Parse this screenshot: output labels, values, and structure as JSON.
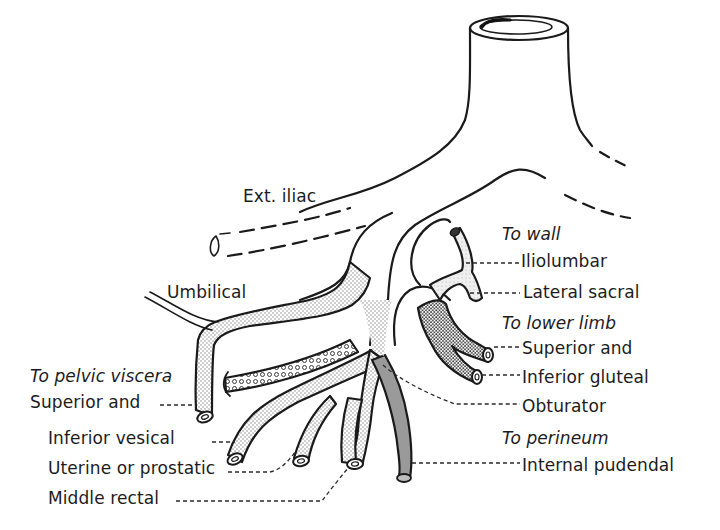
{
  "diagram": {
    "colors": {
      "line": "#1a1a1a",
      "stipple_light": "#d9d9d9",
      "stipple_dense": "#bdbdbd",
      "internal_pudendal_fill": "#9a9a9a",
      "background": "#ffffff"
    },
    "vessels": {
      "trunk": "common-iliac-trunk",
      "external_iliac": "Ext. iliac",
      "umbilical": "Umbilical"
    },
    "groups": [
      {
        "heading": "To wall",
        "branches": [
          "Iliolumbar",
          "Lateral sacral"
        ]
      },
      {
        "heading": "To lower limb",
        "branches": [
          "Superior and",
          "Inferior gluteal"
        ]
      },
      {
        "heading": null,
        "branches": [
          "Obturator"
        ]
      },
      {
        "heading": "To perineum",
        "branches": [
          "Internal pudendal"
        ]
      },
      {
        "heading": "To pelvic viscera",
        "branches": [
          "Superior and",
          "Inferior vesical",
          "Uterine or prostatic",
          "Middle rectal"
        ]
      }
    ]
  },
  "labels": {
    "ext_iliac": "Ext. iliac",
    "umbilical": "Umbilical",
    "to_wall": "To wall",
    "iliolumbar": "Iliolumbar",
    "lateral_sacral": "Lateral sacral",
    "to_lower_limb": "To lower limb",
    "superior_gluteal": "Superior and",
    "inferior_gluteal": "Inferior gluteal",
    "obturator": "Obturator",
    "to_perineum": "To perineum",
    "internal_pudendal": "Internal pudendal",
    "to_pelvic_viscera": "To pelvic viscera",
    "superior_vesical": "Superior and",
    "inferior_vesical": "Inferior vesical",
    "uterine_prostatic": "Uterine or prostatic",
    "middle_rectal": "Middle rectal"
  }
}
